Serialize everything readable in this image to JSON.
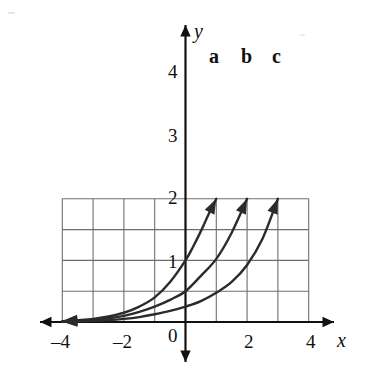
{
  "chart_data": {
    "type": "line",
    "title": "",
    "xlabel": "x",
    "ylabel": "y",
    "xlim": [
      -4,
      4
    ],
    "ylim": [
      0,
      4
    ],
    "grid": true,
    "grid_step": 1,
    "legend": "inline-curve-labels",
    "x_ticks": [
      {
        "value": -4,
        "label": "–4"
      },
      {
        "value": -2,
        "label": "–2"
      },
      {
        "value": 0,
        "label": "0"
      },
      {
        "value": 2,
        "label": "2"
      },
      {
        "value": 4,
        "label": "4"
      }
    ],
    "y_ticks": [
      {
        "value": 1,
        "label": "1"
      },
      {
        "value": 2,
        "label": "2"
      },
      {
        "value": 3,
        "label": "3"
      },
      {
        "value": 4,
        "label": "4"
      }
    ],
    "series": [
      {
        "name": "a",
        "label": "a",
        "color": "#2b2b2b",
        "y_intercept": 2,
        "arrow_start": [
          -4,
          0
        ],
        "arrow_end": [
          1,
          4
        ],
        "points": [
          [
            -4,
            0.03
          ],
          [
            -3.5,
            0.06
          ],
          [
            -3,
            0.1
          ],
          [
            -2.5,
            0.18
          ],
          [
            -2,
            0.3
          ],
          [
            -1.5,
            0.5
          ],
          [
            -1,
            0.8
          ],
          [
            -0.5,
            1.3
          ],
          [
            0,
            2
          ],
          [
            0.25,
            2.45
          ],
          [
            0.5,
            2.95
          ],
          [
            0.75,
            3.5
          ],
          [
            1,
            4
          ]
        ]
      },
      {
        "name": "b",
        "label": "b",
        "color": "#2b2b2b",
        "y_intercept": 1,
        "arrow_start": [
          -4,
          0
        ],
        "arrow_end": [
          2,
          4
        ],
        "points": [
          [
            -4,
            0.02
          ],
          [
            -3.5,
            0.04
          ],
          [
            -3,
            0.07
          ],
          [
            -2.5,
            0.12
          ],
          [
            -2,
            0.2
          ],
          [
            -1.5,
            0.33
          ],
          [
            -1,
            0.5
          ],
          [
            -0.5,
            0.72
          ],
          [
            0,
            1
          ],
          [
            0.5,
            1.5
          ],
          [
            1,
            2.05
          ],
          [
            1.5,
            2.9
          ],
          [
            2,
            4
          ]
        ]
      },
      {
        "name": "c",
        "label": "c",
        "color": "#2b2b2b",
        "y_intercept": 0.5,
        "arrow_start": [
          -4,
          0
        ],
        "arrow_end": [
          3,
          4
        ],
        "points": [
          [
            -4,
            0.01
          ],
          [
            -3.5,
            0.02
          ],
          [
            -3,
            0.035
          ],
          [
            -2.5,
            0.06
          ],
          [
            -2,
            0.1
          ],
          [
            -1.5,
            0.16
          ],
          [
            -1,
            0.25
          ],
          [
            -0.5,
            0.36
          ],
          [
            0,
            0.5
          ],
          [
            0.5,
            0.68
          ],
          [
            1,
            0.95
          ],
          [
            1.5,
            1.3
          ],
          [
            2,
            1.85
          ],
          [
            2.5,
            2.7
          ],
          [
            3,
            4
          ]
        ]
      }
    ]
  },
  "axes": {
    "x_axis_name": "x",
    "y_axis_name": "y",
    "origin_label": "0"
  },
  "colors": {
    "curve": "#2b2b2b",
    "grid": "#6e6e6e",
    "axis": "#111111",
    "background": "#ffffff"
  }
}
